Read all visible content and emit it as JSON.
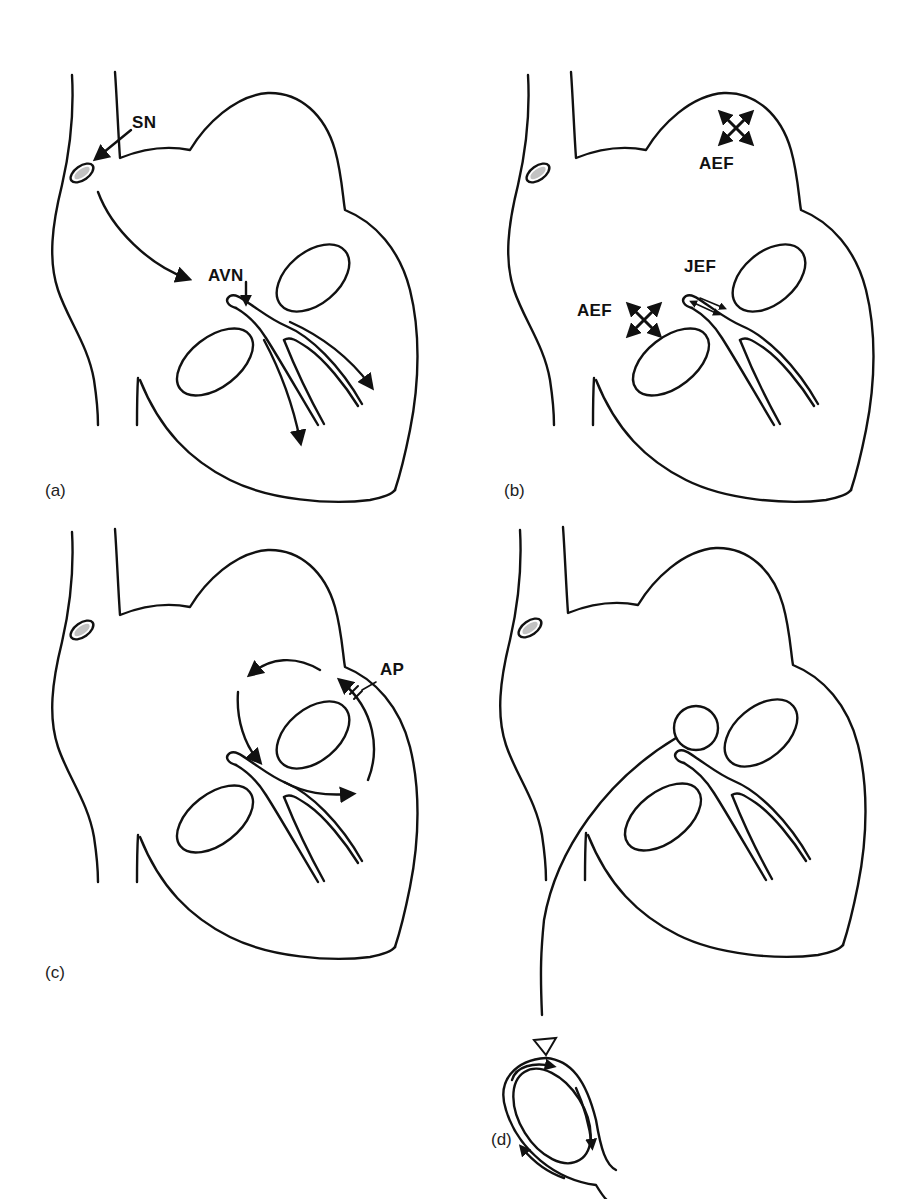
{
  "figure": {
    "panels": [
      {
        "id": "a",
        "label": "(a)",
        "annotations": {
          "sinus_node": "SN",
          "av_node": "AVN"
        },
        "description": "Normal conduction: impulse from sinus node (SN) travels to AV node (AVN) and down the bundle branches"
      },
      {
        "id": "b",
        "label": "(b)",
        "annotations": {
          "atrial_ectopic_focus_top": "AEF",
          "junctional_ectopic_focus": "JEF",
          "atrial_ectopic_focus_left": "AEF"
        },
        "description": "Ectopic foci: atrial ectopic foci (AEF) and junctional ectopic focus (JEF)"
      },
      {
        "id": "c",
        "label": "(c)",
        "annotations": {
          "accessory_pathway": "AP"
        },
        "description": "Re-entry circuit through an accessory pathway (AP)"
      },
      {
        "id": "d",
        "label": "(d)",
        "annotations": {},
        "description": "Re-entry circuit within the AV node, shown enlarged"
      }
    ]
  },
  "colors": {
    "line": "#111111",
    "background": "#ffffff"
  }
}
